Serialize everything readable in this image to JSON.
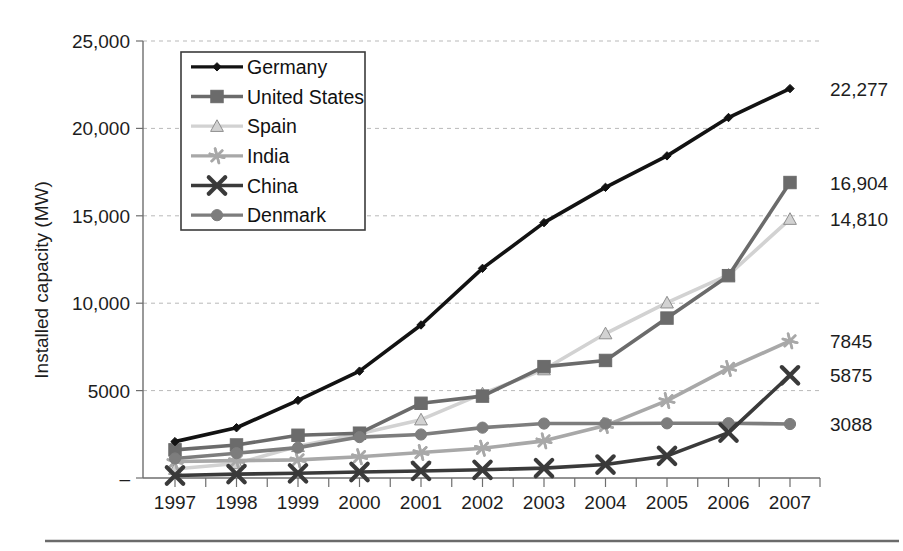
{
  "chart_data": {
    "type": "line",
    "title": "",
    "xlabel": "",
    "ylabel": "Installed capacity (MW)",
    "x": [
      "1997",
      "1998",
      "1999",
      "2000",
      "2001",
      "2002",
      "2003",
      "2004",
      "2005",
      "2006",
      "2007"
    ],
    "categories": [
      "1997",
      "1998",
      "1999",
      "2000",
      "2001",
      "2002",
      "2003",
      "2004",
      "2005",
      "2006",
      "2007"
    ],
    "ylim": [
      0,
      25000
    ],
    "ytick_labels": [
      "25,000",
      "20,000",
      "15,000",
      "10,000",
      "5000",
      "–"
    ],
    "ytick_values": [
      25000,
      20000,
      15000,
      10000,
      5000,
      0
    ],
    "grid": true,
    "legend_position": "top-left-inside",
    "series": [
      {
        "name": "Germany",
        "marker": "diamond",
        "color": "#121212",
        "end_label": "22,277",
        "values": [
          2081,
          2875,
          4442,
          6113,
          8754,
          11994,
          14609,
          16629,
          18428,
          20622,
          22277
        ]
      },
      {
        "name": "United States",
        "marker": "square",
        "color": "#6b6b6b",
        "end_label": "16,904",
        "values": [
          1611,
          1890,
          2445,
          2564,
          4275,
          4685,
          6372,
          6725,
          9149,
          11575,
          16904
        ]
      },
      {
        "name": "Spain",
        "marker": "triangle",
        "color": "#d2d2d2",
        "end_label": "14,810",
        "values": [
          512,
          834,
          1812,
          2535,
          3337,
          4825,
          6203,
          8263,
          10028,
          11615,
          14810
        ]
      },
      {
        "name": "India",
        "marker": "asterisk",
        "color": "#a8a8a8",
        "end_label": "7845",
        "values": [
          940,
          992,
          1035,
          1220,
          1456,
          1702,
          2125,
          3000,
          4430,
          6270,
          7845
        ]
      },
      {
        "name": "China",
        "marker": "cross",
        "color": "#3a3a3a",
        "end_label": "5875",
        "values": [
          146,
          224,
          268,
          346,
          404,
          468,
          567,
          769,
          1266,
          2599,
          5875
        ]
      },
      {
        "name": "Denmark",
        "marker": "circle",
        "color": "#7d7d7d",
        "end_label": "3088",
        "values": [
          1116,
          1420,
          1738,
          2340,
          2489,
          2880,
          3115,
          3118,
          3128,
          3136,
          3088
        ]
      }
    ]
  },
  "legend": {
    "entries": [
      "Germany",
      "United States",
      "Spain",
      "India",
      "China",
      "Denmark"
    ]
  },
  "axis": {
    "y_title": "Installed capacity (MW)"
  }
}
